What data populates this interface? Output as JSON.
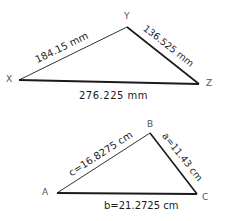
{
  "diagrams": [
    {
      "name": "triangle-xyz",
      "vertices": {
        "X": {
          "label": "X",
          "x": 19,
          "y": 80
        },
        "Y": {
          "label": "Y",
          "x": 127,
          "y": 27
        },
        "Z": {
          "label": "Z",
          "x": 199,
          "y": 84
        }
      },
      "sides": {
        "xy": {
          "label": "184.15 mm",
          "value": 184.15,
          "unit": "mm"
        },
        "yz": {
          "label": "136.525 mm",
          "value": 136.525,
          "unit": "mm"
        },
        "xz": {
          "label": "276.225 mm",
          "value": 276.225,
          "unit": "mm"
        }
      }
    },
    {
      "name": "triangle-abc",
      "vertices": {
        "A": {
          "label": "A",
          "x": 57,
          "y": 193
        },
        "B": {
          "label": "B",
          "x": 150,
          "y": 133
        },
        "C": {
          "label": "C",
          "x": 197,
          "y": 194
        }
      },
      "sides": {
        "c": {
          "label": "c=16.8275 cm",
          "value": 16.8275,
          "unit": "cm"
        },
        "a": {
          "label": "a=11.43 cm",
          "value": 11.43,
          "unit": "cm"
        },
        "b": {
          "label": "b=21.2725 cm",
          "value": 21.2725,
          "unit": "cm"
        }
      }
    }
  ],
  "colors": {
    "line": "#1a1a1a",
    "vertex_label": "#555555",
    "background": "#ffffff"
  }
}
